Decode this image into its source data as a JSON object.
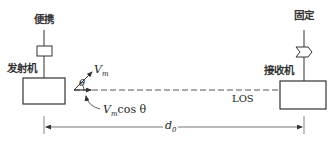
{
  "diagram": {
    "transmitter": {
      "label": "发射机",
      "antenna_label": "便携"
    },
    "receiver": {
      "label": "接收机",
      "antenna_label": "固定"
    },
    "vectors": {
      "velocity": "V",
      "velocity_sub": "m",
      "angle": "θ",
      "projection_prefix": "V",
      "projection_sub": "m",
      "projection_suffix": "cos θ"
    },
    "path_label": "LOS",
    "distance": {
      "symbol": "d",
      "sub": "0"
    },
    "colors": {
      "line": "#333333",
      "background": "#ffffff"
    }
  }
}
